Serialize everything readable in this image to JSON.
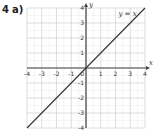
{
  "question": {
    "number": "4",
    "part": "a)"
  },
  "chart_data": {
    "type": "line",
    "title": "",
    "xlabel": "x",
    "ylabel": "y",
    "xlim": [
      -4,
      4
    ],
    "ylim": [
      -4,
      4
    ],
    "grid": true,
    "grid_minor_step": 0.5,
    "x_ticks": [
      "-4",
      "-3",
      "-2",
      "-1",
      "1",
      "2",
      "3",
      "4"
    ],
    "y_ticks": [
      "4",
      "3",
      "2",
      "1",
      "-1",
      "-2",
      "-3",
      "-4"
    ],
    "origin_label": "0",
    "series": [
      {
        "name": "y = x",
        "x": [
          -4,
          4
        ],
        "y": [
          -4,
          4
        ],
        "color": "#333333"
      }
    ],
    "annotations": [
      {
        "text": "y = x",
        "x": 2.2,
        "y": 3.5
      }
    ]
  }
}
